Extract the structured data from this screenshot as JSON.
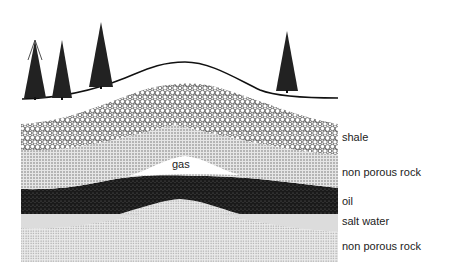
{
  "diagram": {
    "layers": [
      {
        "id": "shale",
        "label": "shale"
      },
      {
        "id": "non-porous-rock-upper",
        "label": "non porous rock"
      },
      {
        "id": "gas",
        "label": "gas"
      },
      {
        "id": "oil",
        "label": "oil"
      },
      {
        "id": "salt-water",
        "label": "salt water"
      },
      {
        "id": "non-porous-rock-lower",
        "label": "non porous rock"
      }
    ],
    "trees": 4,
    "colors": {
      "ink": "#111111",
      "oil": "#1a1a1a",
      "rock": "#c8c8c8",
      "salt_water": "#dcdcdc",
      "gas": "#ffffff"
    }
  }
}
